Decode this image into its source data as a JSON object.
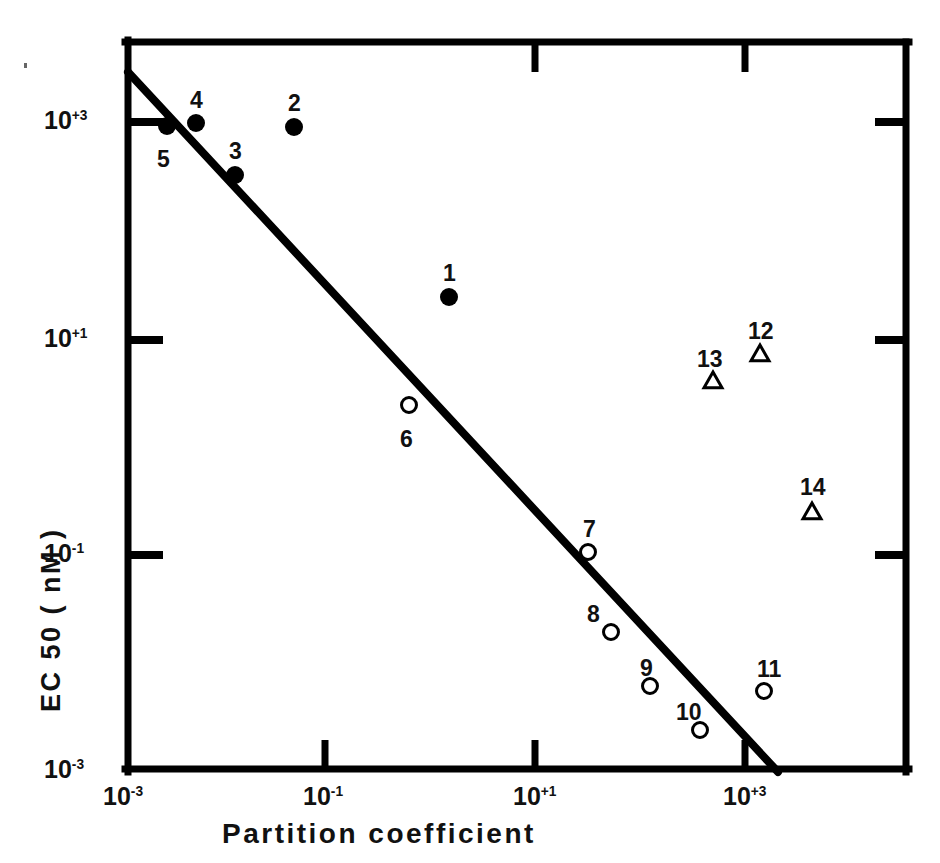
{
  "figure": {
    "background_color": "#ffffff",
    "ink_color": "#000000"
  },
  "chart_data": {
    "type": "scatter",
    "title": "",
    "xlabel": "Partition coefficient",
    "ylabel": "EC 50 ( nM )",
    "x_scale": "log10",
    "y_scale": "log10",
    "xlim": [
      0.001,
      12600
    ],
    "ylim": [
      0.001,
      15800
    ],
    "grid": false,
    "legend": "none",
    "x_tick_labels": [
      "10-3",
      "10-1",
      "10+1",
      "10+3"
    ],
    "x_tick_mantissa": [
      "10",
      "10",
      "10",
      "10"
    ],
    "x_tick_exponents": [
      "-3",
      "-1",
      "+1",
      "+3"
    ],
    "x_tick_values": [
      0.001,
      0.1,
      10,
      1000
    ],
    "y_tick_labels": [
      "10+3",
      "10+1",
      "10-1",
      "10-3"
    ],
    "y_tick_mantissa": [
      "10",
      "10",
      "10",
      "10"
    ],
    "y_tick_exponents": [
      "+3",
      "+1",
      "-1",
      "-3"
    ],
    "y_tick_values": [
      1000,
      10,
      0.1,
      0.001
    ],
    "series": [
      {
        "name": "filled-circles",
        "marker": "filled-circle",
        "points": [
          {
            "label": "1",
            "x": 0.55,
            "y": 2.2,
            "px": 449,
            "py": 297,
            "lx": 443,
            "ly": 262
          },
          {
            "label": "2",
            "x": 0.05,
            "y": 920,
            "px": 294,
            "py": 127,
            "lx": 288,
            "ly": 92
          },
          {
            "label": "3",
            "x": 0.0115,
            "y": 290,
            "px": 235,
            "py": 175,
            "lx": 229,
            "ly": 140
          },
          {
            "label": "4",
            "x": 0.0046,
            "y": 1150,
            "px": 196,
            "py": 123,
            "lx": 190,
            "ly": 89
          },
          {
            "label": "5",
            "x": 0.0026,
            "y": 1000,
            "px": 167,
            "py": 126,
            "lx": 157,
            "ly": 148
          }
        ]
      },
      {
        "name": "open-circles",
        "marker": "open-circle",
        "points": [
          {
            "label": "6",
            "x": 0.29,
            "y": 0.23,
            "px": 409,
            "py": 405,
            "lx": 400,
            "ly": 428
          },
          {
            "label": "7",
            "x": 4.4,
            "y": 0.082,
            "px": 588,
            "py": 552,
            "lx": 583,
            "ly": 518
          },
          {
            "label": "8",
            "x": 16.0,
            "y": 0.0145,
            "px": 611,
            "py": 632,
            "lx": 587,
            "ly": 603
          },
          {
            "label": "9",
            "x": 105.0,
            "y": 0.0043,
            "px": 650,
            "py": 686,
            "lx": 640,
            "ly": 657
          },
          {
            "label": "10",
            "x": 410.0,
            "y": 0.00165,
            "px": 700,
            "py": 730,
            "lx": 676,
            "ly": 701
          },
          {
            "label": "11",
            "x": 1450.0,
            "y": 0.0039,
            "px": 764,
            "py": 691,
            "lx": 757,
            "ly": 658
          }
        ]
      },
      {
        "name": "open-triangles",
        "marker": "open-triangle",
        "points": [
          {
            "label": "12",
            "x": 1270.0,
            "y": 7.2,
            "px": 760,
            "py": 354,
            "lx": 748,
            "ly": 320
          },
          {
            "label": "13",
            "x": 530.0,
            "y": 3.5,
            "px": 713,
            "py": 381,
            "lx": 697,
            "ly": 348
          },
          {
            "label": "14",
            "x": 3800.0,
            "y": 0.21,
            "px": 812,
            "py": 512,
            "lx": 800,
            "ly": 476
          }
        ]
      }
    ],
    "trendline": {
      "name": "regression-line",
      "x_start": 0.001,
      "y_start": 3200,
      "x_end": 3000,
      "y_end": 0.001,
      "px_start": 128,
      "py_start": 72,
      "px_end": 778,
      "py_end": 772
    }
  },
  "axes": {
    "frame": {
      "left": 125,
      "top": 40,
      "right": 909,
      "bottom": 772
    }
  }
}
